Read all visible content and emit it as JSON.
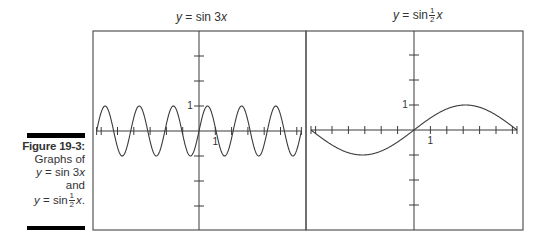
{
  "caption": {
    "figure_label": "Figure 19-3:",
    "line1": "Graphs of",
    "line2_var": "y",
    "line2_rest": " = sin 3",
    "line2_x": "x",
    "line3": "and",
    "line4_var": "y",
    "line4_rest": " = sin",
    "line4_num": "1",
    "line4_den": "2",
    "line4_x": "x",
    "line4_end": "."
  },
  "panels": {
    "left": {
      "title_var": "y",
      "title_rest": " = sin 3",
      "title_x": "x"
    },
    "right": {
      "title_var": "y",
      "title_rest": " = sin",
      "title_num": "1",
      "title_den": "2",
      "title_x": "x"
    }
  },
  "colors": {
    "axis": "#3a3a3a",
    "curve": "#3a3a3a",
    "frame": "#555555",
    "bar": "#000000"
  },
  "chart_data": [
    {
      "type": "line",
      "title": "y = sin 3x",
      "function": "sin(3x)",
      "xlabel": "",
      "ylabel": "",
      "xlim": [
        -6.28,
        6.28
      ],
      "ylim": [
        -3,
        3
      ],
      "x_ticks": [
        -6,
        -5,
        -4,
        -3,
        -2,
        -1,
        1,
        2,
        3,
        4,
        5,
        6
      ],
      "y_ticks": [
        -3,
        -2,
        -1,
        1,
        2,
        3
      ],
      "tick_labels": {
        "x": [
          "1"
        ],
        "y": [
          "1"
        ]
      },
      "series": [
        {
          "name": "sin 3x",
          "amplitude": 1,
          "period": 2.094,
          "x_range": [
            -6.283,
            6.283
          ]
        }
      ],
      "grid": false
    },
    {
      "type": "line",
      "title": "y = sin ½x",
      "function": "sin(x/2)",
      "xlabel": "",
      "ylabel": "",
      "xlim": [
        -6.28,
        6.28
      ],
      "ylim": [
        -3,
        3
      ],
      "x_ticks": [
        -6,
        -5,
        -4,
        -3,
        -2,
        -1,
        1,
        2,
        3,
        4,
        5,
        6
      ],
      "y_ticks": [
        -3,
        -2,
        -1,
        1,
        2,
        3
      ],
      "tick_labels": {
        "x": [
          "1"
        ],
        "y": [
          "1"
        ]
      },
      "series": [
        {
          "name": "sin ½x",
          "amplitude": 1,
          "period": 12.566,
          "x_range": [
            -6.283,
            6.283
          ]
        }
      ],
      "grid": false
    }
  ]
}
